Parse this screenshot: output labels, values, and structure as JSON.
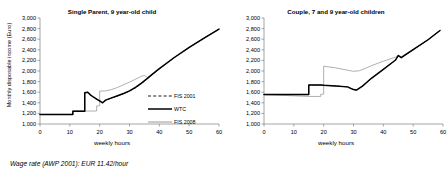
{
  "figure": {
    "footnote": "Wage rate (AWP 2001): EUR 11.42/hour",
    "colors": {
      "fis2001": "#1a1a1a",
      "wtc": "#000000",
      "fis2008": "#8c8c8c",
      "axis": "#808080",
      "text": "#000000",
      "background": "#ffffff"
    }
  },
  "chart_data": [
    {
      "type": "line",
      "panel": "left",
      "title": "Single Parent, 9 year-old child",
      "xlabel": "weekly hours",
      "ylabel": "Monthly disposable income (Euro)",
      "xlim": [
        0,
        60
      ],
      "ylim": [
        1000,
        3000
      ],
      "xticks": [
        0,
        10,
        20,
        30,
        40,
        50,
        60
      ],
      "xticklabels": [
        "0",
        "10",
        "20",
        "30",
        "40",
        "50",
        "60"
      ],
      "yticks": [
        1000,
        1200,
        1400,
        1600,
        1800,
        2000,
        2200,
        2400,
        2600,
        2800,
        3000
      ],
      "yticklabels": [
        "1,000",
        "1,200",
        "1,400",
        "1,600",
        "1,800",
        "2,000",
        "2,200",
        "2,400",
        "2,600",
        "2,800",
        "3,000"
      ],
      "grid": false,
      "legend_position": "center-right",
      "series": [
        {
          "name": "FIS 2001",
          "style": "dashed",
          "color": "#1a1a1a",
          "points": [
            [
              0,
              1180
            ],
            [
              11,
              1180
            ],
            [
              11,
              1240
            ],
            [
              15,
              1240
            ],
            [
              15,
              1590
            ],
            [
              16,
              1600
            ],
            [
              17,
              1540
            ],
            [
              18,
              1500
            ],
            [
              19,
              1465
            ],
            [
              20,
              1430
            ],
            [
              21,
              1400
            ],
            [
              22,
              1450
            ],
            [
              24,
              1490
            ],
            [
              26,
              1530
            ],
            [
              28,
              1570
            ],
            [
              30,
              1620
            ],
            [
              32,
              1680
            ],
            [
              34,
              1760
            ],
            [
              36,
              1855
            ],
            [
              38,
              1950
            ],
            [
              40,
              2040
            ],
            [
              45,
              2250
            ],
            [
              50,
              2440
            ],
            [
              55,
              2620
            ],
            [
              60,
              2790
            ]
          ]
        },
        {
          "name": "WTC",
          "style": "solid-thick",
          "color": "#000000",
          "points": [
            [
              0,
              1180
            ],
            [
              11,
              1180
            ],
            [
              11,
              1240
            ],
            [
              15,
              1240
            ],
            [
              15,
              1590
            ],
            [
              16,
              1600
            ],
            [
              17,
              1545
            ],
            [
              18,
              1505
            ],
            [
              19,
              1470
            ],
            [
              20,
              1435
            ],
            [
              21,
              1400
            ],
            [
              22,
              1450
            ],
            [
              24,
              1492
            ],
            [
              26,
              1534
            ],
            [
              28,
              1576
            ],
            [
              30,
              1625
            ],
            [
              32,
              1690
            ],
            [
              34,
              1770
            ],
            [
              36,
              1860
            ],
            [
              38,
              1955
            ],
            [
              40,
              2045
            ],
            [
              45,
              2255
            ],
            [
              50,
              2445
            ],
            [
              55,
              2620
            ],
            [
              60,
              2790
            ]
          ]
        },
        {
          "name": "FIS 2008",
          "style": "solid-thin",
          "color": "#8c8c8c",
          "points": [
            [
              0,
              1180
            ],
            [
              11,
              1180
            ],
            [
              11,
              1245
            ],
            [
              19,
              1245
            ],
            [
              19,
              1340
            ],
            [
              20,
              1345
            ],
            [
              20,
              1620
            ],
            [
              22,
              1625
            ],
            [
              24,
              1650
            ],
            [
              26,
              1690
            ],
            [
              28,
              1740
            ],
            [
              30,
              1790
            ],
            [
              32,
              1845
            ],
            [
              34,
              1900
            ],
            [
              35,
              1915
            ],
            [
              36,
              1880
            ],
            [
              38,
              1945
            ],
            [
              40,
              2040
            ],
            [
              45,
              2255
            ],
            [
              50,
              2445
            ],
            [
              55,
              2620
            ],
            [
              60,
              2790
            ]
          ]
        }
      ],
      "legend": [
        {
          "label": "FIS 2001",
          "style": "dashed",
          "color": "#1a1a1a"
        },
        {
          "label": "WTC",
          "style": "solid-thick",
          "color": "#000000"
        },
        {
          "label": "FIS 2008",
          "style": "solid-thin",
          "color": "#8c8c8c"
        }
      ]
    },
    {
      "type": "line",
      "panel": "right",
      "title": "Couple, 7 and 9 year-old children",
      "xlabel": "weekly hours",
      "ylabel": "",
      "xlim": [
        0,
        60
      ],
      "ylim": [
        1000,
        3000
      ],
      "xticks": [
        0,
        10,
        20,
        30,
        40,
        50,
        60
      ],
      "xticklabels": [
        "0",
        "10",
        "20",
        "30",
        "40",
        "50",
        "60"
      ],
      "yticks": [
        1000,
        1200,
        1400,
        1600,
        1800,
        2000,
        2200,
        2400,
        2600,
        2800,
        3000
      ],
      "yticklabels": [
        "1,000",
        "1,200",
        "1,400",
        "1,600",
        "1,800",
        "2,000",
        "2,200",
        "2,400",
        "2,600",
        "2,800",
        "3,000"
      ],
      "grid": false,
      "legend_position": "none",
      "series": [
        {
          "name": "FIS 2001",
          "style": "dashed",
          "color": "#1a1a1a",
          "points": [
            [
              0,
              1555
            ],
            [
              15,
              1555
            ],
            [
              15,
              1735
            ],
            [
              19,
              1735
            ],
            [
              20,
              1730
            ],
            [
              24,
              1718
            ],
            [
              28,
              1700
            ],
            [
              30,
              1650
            ],
            [
              31,
              1640
            ],
            [
              33,
              1715
            ],
            [
              36,
              1860
            ],
            [
              40,
              2030
            ],
            [
              44,
              2200
            ],
            [
              45,
              2290
            ],
            [
              46,
              2250
            ],
            [
              50,
              2400
            ],
            [
              55,
              2590
            ],
            [
              59,
              2765
            ]
          ]
        },
        {
          "name": "WTC",
          "style": "solid-thick",
          "color": "#000000",
          "points": [
            [
              0,
              1555
            ],
            [
              15,
              1555
            ],
            [
              15,
              1735
            ],
            [
              19,
              1735
            ],
            [
              20,
              1730
            ],
            [
              24,
              1718
            ],
            [
              28,
              1700
            ],
            [
              30,
              1650
            ],
            [
              31,
              1640
            ],
            [
              33,
              1715
            ],
            [
              36,
              1862
            ],
            [
              40,
              2032
            ],
            [
              44,
              2202
            ],
            [
              45,
              2292
            ],
            [
              46,
              2252
            ],
            [
              50,
              2402
            ],
            [
              55,
              2590
            ],
            [
              59,
              2765
            ]
          ]
        },
        {
          "name": "FIS 2008",
          "style": "solid-thin",
          "color": "#8c8c8c",
          "points": [
            [
              0,
              1555
            ],
            [
              15,
              1520
            ],
            [
              19,
              1520
            ],
            [
              19,
              1560
            ],
            [
              20,
              1565
            ],
            [
              20,
              2090
            ],
            [
              24,
              2060
            ],
            [
              28,
              2015
            ],
            [
              30,
              1995
            ],
            [
              32,
              2005
            ],
            [
              34,
              2050
            ],
            [
              36,
              2100
            ],
            [
              40,
              2185
            ],
            [
              44,
              2260
            ],
            [
              45,
              2300
            ],
            [
              46,
              2270
            ],
            [
              50,
              2410
            ],
            [
              55,
              2595
            ],
            [
              59,
              2765
            ]
          ]
        }
      ],
      "legend": []
    }
  ]
}
